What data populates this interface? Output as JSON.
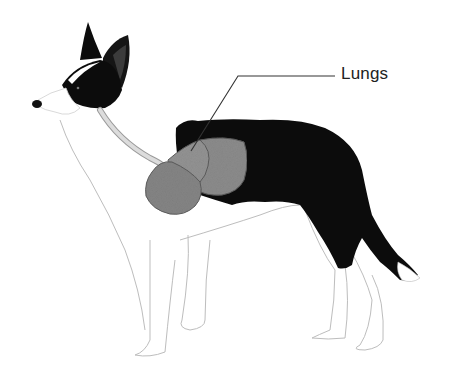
{
  "figure": {
    "label": "Lungs",
    "colors": {
      "background": "#ffffff",
      "coat_black": "#0c0c0c",
      "coat_white": "#ffffff",
      "lung_fill": "#8a8a8a",
      "lung_outline": "#5a5a5a",
      "trachea": "#cfcfcf",
      "leader_line": "#333333",
      "sketch_line": "#b8b8b8"
    },
    "leader_line": {
      "points": [
        [
          191,
          151
        ],
        [
          238,
          76
        ],
        [
          335,
          76
        ]
      ]
    }
  }
}
